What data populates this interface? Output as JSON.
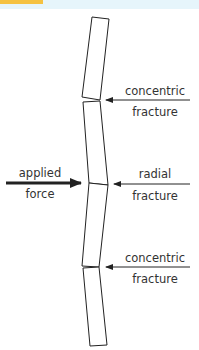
{
  "header_strip": {
    "accent_color": "#f5c242",
    "background_color": "#e6f5fb"
  },
  "diagram": {
    "line_color": "#222222",
    "text_color": "#333333",
    "panes": [
      {
        "points": "92,17 109,19 100,100 82,97"
      },
      {
        "points": "83,102 100,101 108,185 89,183"
      },
      {
        "points": "89,183 108,185 99,267 82,266"
      },
      {
        "points": "83,268 99,267 107,345 90,346"
      }
    ],
    "labels": {
      "concentric_top": {
        "line1": "concentric",
        "line2": "fracture"
      },
      "applied_force": {
        "line1": "applied",
        "line2": "force"
      },
      "radial": {
        "line1": "radial",
        "line2": "fracture"
      },
      "concentric_bottom": {
        "line1": "concentric",
        "line2": "fracture"
      }
    }
  }
}
